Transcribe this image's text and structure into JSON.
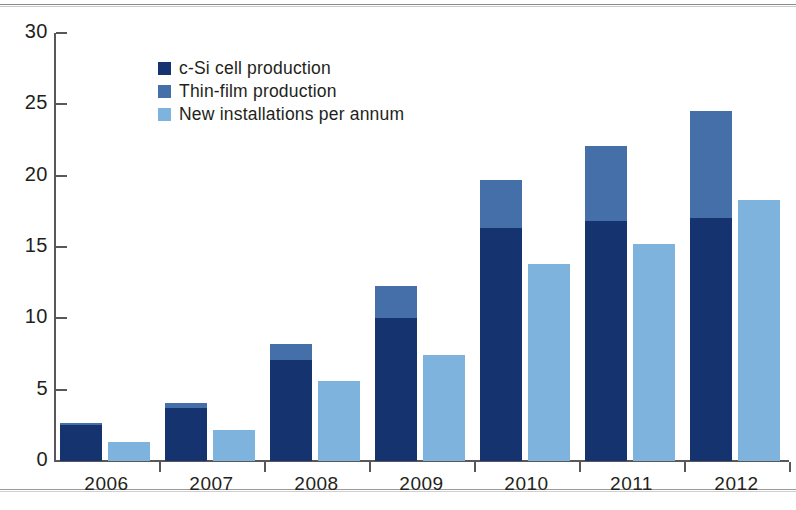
{
  "chart_data": {
    "type": "bar",
    "title": "",
    "subtitle": "",
    "xlabel": "",
    "ylabel": "",
    "categories": [
      "2006",
      "2007",
      "2008",
      "2009",
      "2010",
      "2011",
      "2012"
    ],
    "ylim": [
      0,
      30
    ],
    "yticks": [
      0,
      5,
      10,
      15,
      20,
      25,
      30
    ],
    "ytick_labels": [
      "0",
      "5",
      "10",
      "15",
      "20",
      "25",
      "30"
    ],
    "grid": false,
    "legend_position": "inside-top-left",
    "stacked_group": [
      "c-Si cell production",
      "Thin-film production"
    ],
    "series": [
      {
        "name": "c-Si cell production",
        "color": "#15336e",
        "stack": "production",
        "values": [
          2.5,
          3.7,
          7.1,
          10.0,
          16.3,
          16.8,
          17.0
        ]
      },
      {
        "name": "Thin-film production",
        "color": "#456fa8",
        "stack": "production",
        "values": [
          0.2,
          0.4,
          1.1,
          2.3,
          3.4,
          5.3,
          7.5
        ]
      },
      {
        "name": "New installations per annum",
        "color": "#7eb3dd",
        "stack": "installations",
        "values": [
          1.3,
          2.2,
          5.6,
          7.4,
          13.8,
          15.2,
          18.3
        ]
      }
    ],
    "stack_totals": [
      2.7,
      4.1,
      8.2,
      12.3,
      19.7,
      22.1,
      24.5
    ]
  },
  "legend": {
    "items": [
      {
        "label": "c-Si cell production",
        "color": "#15336e"
      },
      {
        "label": "Thin-film production",
        "color": "#456fa8"
      },
      {
        "label": "New installations per annum",
        "color": "#7eb3dd"
      }
    ]
  },
  "axis": {
    "y_labels": [
      "30",
      "25",
      "20",
      "15",
      "10",
      "5",
      "0"
    ],
    "x_labels": [
      "2006",
      "2007",
      "2008",
      "2009",
      "2010",
      "2011",
      "2012"
    ]
  },
  "colors": {
    "csi": "#15336e",
    "thin_film": "#456fa8",
    "installations": "#7eb3dd",
    "axis": "#58585a",
    "text": "#231f20",
    "background": "#ffffff"
  }
}
